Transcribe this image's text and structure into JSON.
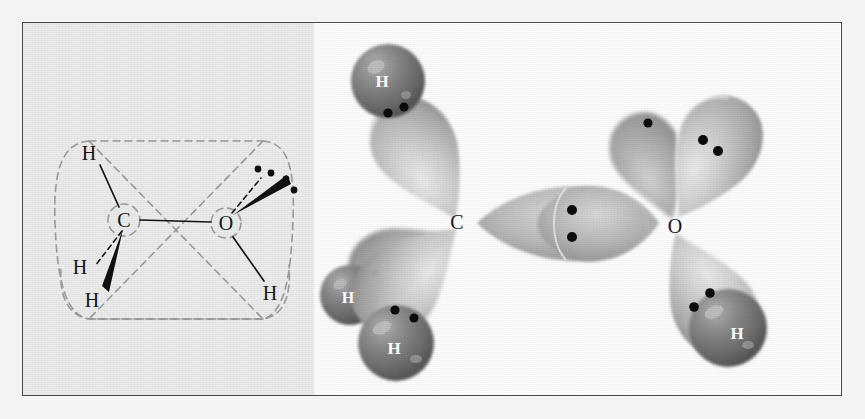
{
  "figure": {
    "border_color": "#4a4a4a",
    "outer_background": "#f3f3f3"
  },
  "panel_left": {
    "name": "structural-formula-panel",
    "background": "#ebebeb",
    "description": "Wedge-and-dash structural formula of methanol with two dashed tetrahedral outlines crossing at a bowtie",
    "atoms": [
      {
        "label": "C",
        "x": 101,
        "y": 197
      },
      {
        "label": "O",
        "x": 203,
        "y": 200
      },
      {
        "label": "H",
        "x": 66,
        "y": 130
      },
      {
        "label": "H",
        "x": 57,
        "y": 244
      },
      {
        "label": "H",
        "x": 69,
        "y": 272
      },
      {
        "label": "H",
        "x": 247,
        "y": 270
      }
    ],
    "bonds": [
      {
        "type": "plain",
        "from": "C",
        "to": "H-top"
      },
      {
        "type": "plain",
        "from": "C",
        "to": "O"
      },
      {
        "type": "dashed",
        "from": "C",
        "to": "H-back"
      },
      {
        "type": "wedge",
        "from": "C",
        "to": "H-front"
      },
      {
        "type": "dashed",
        "from": "O",
        "to": "lone-pair-back"
      },
      {
        "type": "wedge",
        "from": "O",
        "to": "lone-pair-front"
      },
      {
        "type": "plain",
        "from": "O",
        "to": "H-hydroxyl"
      }
    ],
    "lone_pairs": {
      "count": 2,
      "electrons_each": 2,
      "total_dots": 4,
      "on_atom": "O"
    },
    "dashed_outline": {
      "color": "#9a9a9a",
      "style": "dashed",
      "shape": "two crossed tetrahedral envelopes (bowtie)"
    }
  },
  "panel_right": {
    "name": "orbital-overlap-panel",
    "background": "#fdfdfd",
    "description": "sp3 hybrid orbital overlap picture of methanol showing sigma bonds and oxygen lone pairs",
    "atoms": [
      {
        "label": "C",
        "x": 143,
        "y": 198
      },
      {
        "label": "O",
        "x": 361,
        "y": 202
      }
    ],
    "hydrogen_spheres": [
      {
        "label": "H",
        "x": 74,
        "y": 58,
        "r": 37
      },
      {
        "label": "H",
        "x": 36,
        "y": 272,
        "r": 30
      },
      {
        "label": "H",
        "x": 82,
        "y": 320,
        "r": 38
      },
      {
        "label": "H",
        "x": 414,
        "y": 305,
        "r": 39
      }
    ],
    "orbital_lobes": [
      {
        "name": "c-h-sigma-upper-left",
        "angle": -230,
        "electrons": 2
      },
      {
        "name": "c-h-sigma-lower-left",
        "angle": -130,
        "electrons": 2
      },
      {
        "name": "c-h-sigma-lower-back",
        "angle": -155,
        "electrons": 1
      },
      {
        "name": "c-o-sigma-bond",
        "angle": 0,
        "electrons": 2
      },
      {
        "name": "o-lone-pair-upper",
        "angle": -60,
        "electrons": 2
      },
      {
        "name": "o-lone-pair-back",
        "angle": -75,
        "electrons": 1
      },
      {
        "name": "o-h-sigma-lower",
        "angle": 55,
        "electrons": 2
      }
    ],
    "colors": {
      "lobe_light": "#d8d8d8",
      "lobe_mid": "#b4b4b4",
      "lobe_dark": "#8e8e8e",
      "sphere": "#6f6f6f",
      "electron_dot": "#111111",
      "label_dark": "#1a1a1a",
      "label_light": "#ffffff"
    }
  }
}
